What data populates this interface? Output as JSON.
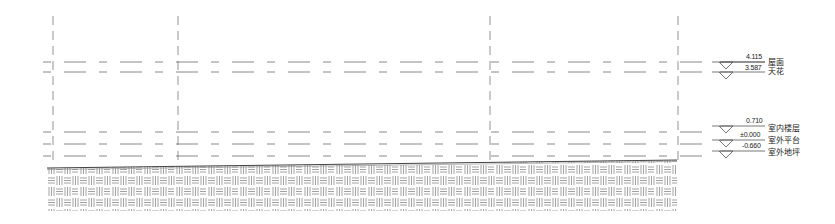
{
  "drawing": {
    "type": "elevation-section",
    "line_color": "#6a6a6a",
    "hatch_color": "#8a8a8a",
    "grid_lines_x": [
      53,
      178,
      490,
      678
    ],
    "levels": [
      {
        "elevation": "4.115",
        "name": "屋面",
        "y": 62
      },
      {
        "elevation": "3.587",
        "name": "天花",
        "y": 72
      },
      {
        "elevation": "0.710",
        "name": "室内楼层",
        "y": 132
      },
      {
        "elevation": "±0.000",
        "name": "室外平台",
        "y": 144
      },
      {
        "elevation": "-0.660",
        "name": "室外地坪",
        "y": 156
      }
    ],
    "ground": {
      "top_left_y": 168,
      "top_right_y": 160,
      "bottom_y": 211,
      "left_x": 47,
      "right_x": 677,
      "pattern": "parquet-earth-hatch"
    }
  }
}
